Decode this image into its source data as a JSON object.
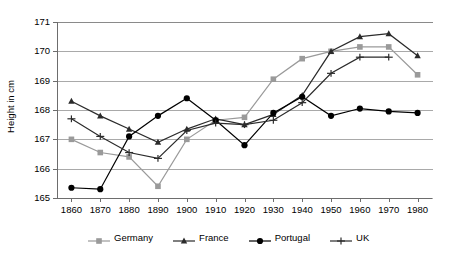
{
  "chart_data": {
    "type": "line",
    "title": "",
    "xlabel": "",
    "ylabel": "Height in cm",
    "x": [
      1860,
      1870,
      1880,
      1890,
      1900,
      1910,
      1920,
      1930,
      1940,
      1950,
      1960,
      1970,
      1980
    ],
    "xlim": [
      1855,
      1985
    ],
    "ylim": [
      165,
      171
    ],
    "yticks": [
      165,
      166,
      167,
      168,
      169,
      170,
      171
    ],
    "xticks": [
      "1860",
      "1870",
      "1880",
      "1890",
      "1900",
      "1910",
      "1920",
      "1930",
      "1940",
      "1950",
      "1960",
      "1970",
      "1980"
    ],
    "grid": true,
    "legend_position": "bottom",
    "series": [
      {
        "name": "Germany",
        "color": "#9a9a9a",
        "marker": "square",
        "values": [
          167.0,
          166.55,
          166.4,
          165.4,
          167.0,
          167.65,
          167.75,
          169.05,
          169.75,
          170.0,
          170.15,
          170.15,
          169.2
        ]
      },
      {
        "name": "France",
        "color": "#2b2b2b",
        "marker": "triangle",
        "values": [
          168.3,
          167.8,
          167.35,
          166.9,
          167.35,
          167.7,
          167.5,
          167.85,
          168.5,
          170.0,
          170.5,
          170.6,
          169.85
        ]
      },
      {
        "name": "Portugal",
        "color": "#000000",
        "marker": "circle",
        "values": [
          165.35,
          165.3,
          167.1,
          167.8,
          168.4,
          167.65,
          166.8,
          167.9,
          168.45,
          167.8,
          168.05,
          167.95,
          167.9
        ]
      },
      {
        "name": "UK",
        "color": "#2b2b2b",
        "marker": "plus",
        "values": [
          167.7,
          167.1,
          166.55,
          166.35,
          167.3,
          167.55,
          167.5,
          167.65,
          168.25,
          169.25,
          169.8,
          169.8,
          null
        ]
      }
    ]
  },
  "legend": {
    "items": [
      {
        "label": "Germany"
      },
      {
        "label": "France"
      },
      {
        "label": "Portugal"
      },
      {
        "label": "UK"
      }
    ]
  }
}
